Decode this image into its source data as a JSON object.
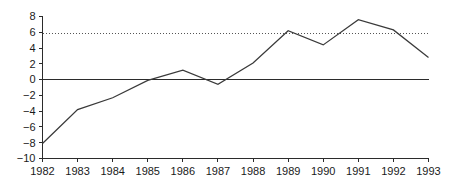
{
  "chart_data": {
    "type": "line",
    "title": "",
    "subtitle": "",
    "xlabel": "",
    "ylabel": "",
    "categories": [
      "1982",
      "1983",
      "1984",
      "1985",
      "1986",
      "1987",
      "1988",
      "1989",
      "1990",
      "1991",
      "1992",
      "1993"
    ],
    "x": [
      1982,
      1983,
      1984,
      1985,
      1986,
      1987,
      1988,
      1989,
      1990,
      1991,
      1992,
      1993
    ],
    "values": [
      -8.1,
      -3.8,
      -2.3,
      -0.1,
      1.2,
      -0.6,
      2.1,
      6.2,
      4.4,
      7.6,
      6.3,
      2.8
    ],
    "series": [
      {
        "name": "series-1",
        "values": [
          -8.1,
          -3.8,
          -2.3,
          -0.1,
          1.2,
          -0.6,
          2.1,
          6.2,
          4.4,
          7.6,
          6.3,
          2.8
        ],
        "color": "#3a3a3a",
        "style": "solid"
      }
    ],
    "reference_lines": [
      {
        "name": "dotted-reference",
        "axis": "y",
        "value": 5.8,
        "style": "dotted",
        "color": "#555555"
      },
      {
        "name": "zero-line",
        "axis": "y",
        "value": 0,
        "style": "solid",
        "color": "#2b2b2b"
      }
    ],
    "ylim": [
      -10,
      8
    ],
    "xlim": [
      1982,
      1993
    ],
    "yticks": [
      8,
      6,
      4,
      2,
      0,
      -2,
      -4,
      -6,
      -8,
      -10
    ],
    "ytick_labels": [
      "8",
      "6",
      "4",
      "2",
      "0",
      "−2",
      "−4",
      "−6",
      "−8",
      "−10"
    ],
    "xticks": [
      1982,
      1983,
      1984,
      1985,
      1986,
      1987,
      1988,
      1989,
      1990,
      1991,
      1992,
      1993
    ],
    "xtick_labels": [
      "1982",
      "1983",
      "1984",
      "1985",
      "1986",
      "1987",
      "1988",
      "1989",
      "1990",
      "1991",
      "1992",
      "1993"
    ],
    "grid": false,
    "legend": null,
    "legend_position": "none",
    "annotations": []
  },
  "colors": {
    "background": "#ffffff",
    "axis": "#2b2b2b",
    "series": "#3a3a3a",
    "reference": "#555555",
    "text": "#1a1a1a"
  }
}
